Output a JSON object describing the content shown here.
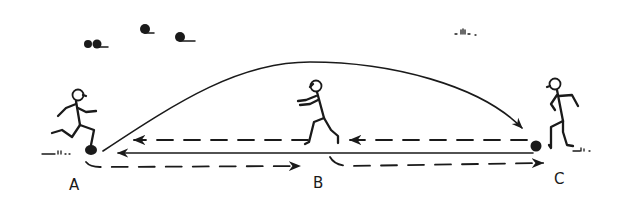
{
  "diagram": {
    "type": "sports drill illustration",
    "background": "#ffffff",
    "ink_color": "#1a1a1a",
    "players": [
      {
        "id": "A",
        "label": "A",
        "pose": "running, kicking ball",
        "has_ball": true
      },
      {
        "id": "B",
        "label": "B",
        "pose": "running toward A"
      },
      {
        "id": "C",
        "label": "C",
        "pose": "standing, ball at feet",
        "has_ball": true
      }
    ],
    "paths": [
      {
        "name": "lofted pass",
        "from": "A",
        "to": "C",
        "style": "solid curve",
        "arrow": "end"
      },
      {
        "name": "ground pass",
        "from": "C",
        "to": "A",
        "style": "solid straight",
        "arrow": "end"
      },
      {
        "name": "run B to A",
        "from": "B",
        "to": "A",
        "style": "dashed",
        "arrow": "end"
      },
      {
        "name": "run C to B",
        "from": "C",
        "to": "B",
        "style": "dashed",
        "arrow": "end"
      },
      {
        "name": "run A to B",
        "from": "A",
        "to": "B",
        "style": "dashed",
        "arrow": "end"
      },
      {
        "name": "run B to C",
        "from": "B",
        "to": "C",
        "style": "dashed",
        "arrow": "end"
      }
    ],
    "labels": {
      "a": "A",
      "b": "B",
      "c": "C"
    },
    "decorations": [
      "birds in sky",
      "grass tufts"
    ]
  }
}
